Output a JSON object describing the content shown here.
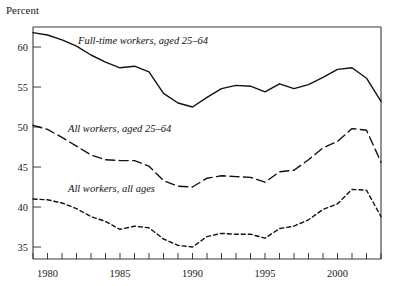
{
  "chart_data": {
    "type": "line",
    "title": "",
    "ylabel": "Percent",
    "xlabel": "",
    "ylim": [
      32,
      64
    ],
    "xlim": [
      1979,
      2003
    ],
    "grid": false,
    "legend_position": "inline-annotations",
    "y_ticks": [
      35,
      40,
      45,
      50,
      55,
      60
    ],
    "y_tick_labels": [
      "35",
      "40",
      "45",
      "50",
      "55",
      "60"
    ],
    "x_ticks": [
      1979,
      1980,
      1981,
      1982,
      1983,
      1984,
      1985,
      1986,
      1987,
      1988,
      1989,
      1990,
      1991,
      1992,
      1993,
      1994,
      1995,
      1996,
      1997,
      1998,
      1999,
      2000,
      2001,
      2002,
      2003
    ],
    "x_tick_labels": [
      "1980",
      "1985",
      "1990",
      "1995",
      "2000"
    ],
    "x_labeled_years": [
      1980,
      1985,
      1990,
      1995,
      2000
    ],
    "x": [
      1979,
      1980,
      1981,
      1982,
      1983,
      1984,
      1985,
      1986,
      1987,
      1988,
      1989,
      1990,
      1991,
      1992,
      1993,
      1994,
      1995,
      1996,
      1997,
      1998,
      1999,
      2000,
      2001,
      2002,
      2003
    ],
    "series": [
      {
        "name": "Full-time workers, aged 25–64",
        "style": "solid",
        "label": "Full-time workers, aged 25–64",
        "values": [
          61.8,
          61.5,
          60.9,
          60.1,
          59.0,
          58.1,
          57.4,
          57.6,
          56.9,
          54.2,
          53.0,
          52.5,
          53.7,
          54.8,
          55.2,
          55.1,
          54.4,
          55.4,
          54.8,
          55.3,
          56.2,
          57.2,
          57.4,
          56.1,
          53.2
        ]
      },
      {
        "name": "All workers, aged 25–64",
        "style": "dashed",
        "label": "All workers, aged 25–64",
        "values": [
          50.2,
          49.7,
          48.7,
          47.6,
          46.5,
          45.9,
          45.8,
          45.8,
          45.1,
          43.3,
          42.6,
          42.5,
          43.6,
          43.9,
          43.8,
          43.7,
          43.1,
          44.4,
          44.6,
          45.9,
          47.4,
          48.2,
          49.8,
          49.6,
          45.6
        ]
      },
      {
        "name": "All workers, all ages",
        "style": "dotted",
        "label": "All workers, all ages",
        "values": [
          41.0,
          40.9,
          40.5,
          39.8,
          38.8,
          38.2,
          37.2,
          37.6,
          37.4,
          36.0,
          35.2,
          35.0,
          36.3,
          36.7,
          36.6,
          36.6,
          36.1,
          37.3,
          37.6,
          38.4,
          39.7,
          40.4,
          42.2,
          42.1,
          38.8
        ]
      }
    ],
    "annotations": [
      {
        "text": "Full-time workers, aged 25–64",
        "x": 1983.2,
        "y": 60.6
      },
      {
        "text": "All workers, aged 25–64",
        "x": 1982.2,
        "y": 49.3
      },
      {
        "text": "All workers, all ages",
        "x": 1982.2,
        "y": 41.4
      }
    ],
    "colors": {
      "line": "#111111",
      "axis": "#3a3a3a",
      "text": "#1a1a1a",
      "background": "#ffffff"
    }
  }
}
